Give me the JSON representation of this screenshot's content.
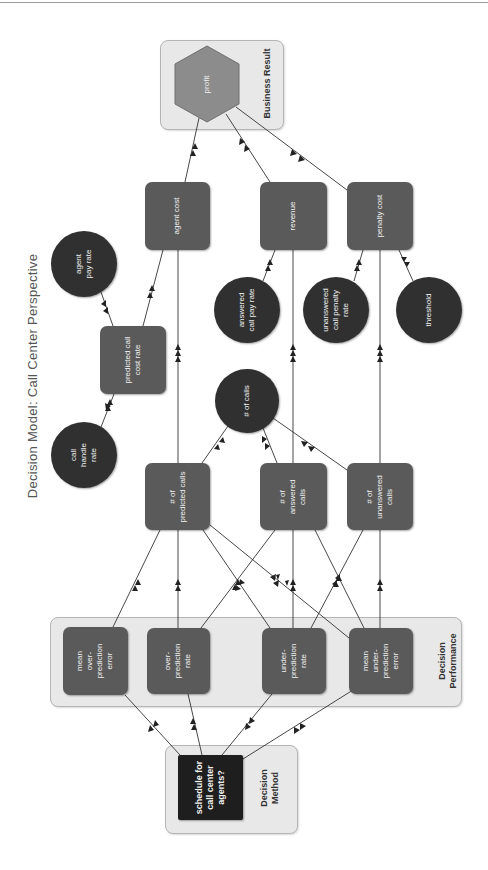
{
  "title": "Decision Model:  Call Center Perspective",
  "colors": {
    "rect_node": "#5a5a5a",
    "circle_node": "#303030",
    "decision_node": "#1e1e1e",
    "hexagon": "#8c8c8c",
    "group_box": "#e8e8e8",
    "edge": "#333333"
  },
  "groups": {
    "business_result": "Business Result",
    "decision_performance": "Decision\nPerformance",
    "decision_method": "Decision\nMethod"
  },
  "nodes": {
    "profit": "profit",
    "agent_cost": "agent cost",
    "revenue": "revenue",
    "penalty_cost": "penalty cost",
    "agent_pay_rate": "agent\npay rate",
    "predicted_call_cost_rate": "predicted call\ncost rate",
    "call_handle_rate": "call\nhandle\nrate",
    "answered_call_pay_rate": "answered\ncall pay rate",
    "unanswered_call_penalty_rate": "unanswered\ncall penalty\nrate",
    "threshold": "threshold",
    "num_calls": "# of calls",
    "num_predicted_calls": "# of\npredicted calls",
    "num_answered_calls": "# of\nanswered\ncalls",
    "num_unanswered_calls": "# of\nunanswered\ncalls",
    "mean_over_prediction_error": "mean\nover-\nprediction\nerror",
    "over_prediction_rate": "over-\nprediction\nrate",
    "under_prediction_rate": "under-\nprediction\nrate",
    "mean_under_prediction_error": "mean\nunder-\nprediction\nerror",
    "schedule": "schedule for\ncall center\nagents?"
  },
  "edges": [
    {
      "from": "agent_cost",
      "to": "profit"
    },
    {
      "from": "revenue",
      "to": "profit"
    },
    {
      "from": "penalty_cost",
      "to": "profit"
    },
    {
      "from": "agent_pay_rate",
      "to": "predicted_call_cost_rate"
    },
    {
      "from": "call_handle_rate",
      "to": "predicted_call_cost_rate"
    },
    {
      "from": "predicted_call_cost_rate",
      "to": "agent_cost"
    },
    {
      "from": "num_predicted_calls",
      "to": "agent_cost"
    },
    {
      "from": "answered_call_pay_rate",
      "to": "revenue"
    },
    {
      "from": "num_answered_calls",
      "to": "revenue"
    },
    {
      "from": "unanswered_call_penalty_rate",
      "to": "penalty_cost"
    },
    {
      "from": "threshold",
      "to": "penalty_cost"
    },
    {
      "from": "num_unanswered_calls",
      "to": "penalty_cost"
    },
    {
      "from": "num_calls",
      "to": "num_predicted_calls"
    },
    {
      "from": "num_calls",
      "to": "num_answered_calls"
    },
    {
      "from": "num_calls",
      "to": "num_unanswered_calls"
    },
    {
      "from": "mean_over_prediction_error",
      "to": "num_predicted_calls"
    },
    {
      "from": "over_prediction_rate",
      "to": "num_predicted_calls"
    },
    {
      "from": "under_prediction_rate",
      "to": "num_predicted_calls"
    },
    {
      "from": "mean_under_prediction_error",
      "to": "num_predicted_calls"
    },
    {
      "from": "over_prediction_rate",
      "to": "num_answered_calls"
    },
    {
      "from": "under_prediction_rate",
      "to": "num_answered_calls"
    },
    {
      "from": "mean_under_prediction_error",
      "to": "num_answered_calls"
    },
    {
      "from": "under_prediction_rate",
      "to": "num_unanswered_calls"
    },
    {
      "from": "mean_under_prediction_error",
      "to": "num_unanswered_calls"
    },
    {
      "from": "schedule",
      "to": "mean_over_prediction_error"
    },
    {
      "from": "schedule",
      "to": "over_prediction_rate"
    },
    {
      "from": "schedule",
      "to": "under_prediction_rate"
    },
    {
      "from": "schedule",
      "to": "mean_under_prediction_error"
    }
  ]
}
